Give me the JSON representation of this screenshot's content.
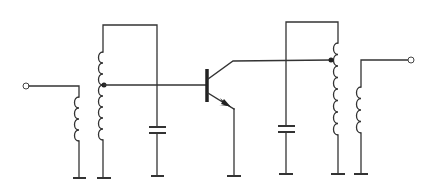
{
  "diagram": {
    "title": "",
    "type": "tuned transistor amplifier schematic",
    "colors": {
      "line": "#333333",
      "background": "#ffffff"
    },
    "components": [
      {
        "id": "input-terminal",
        "kind": "terminal",
        "label": ""
      },
      {
        "id": "input-coil",
        "kind": "inductor",
        "label": ""
      },
      {
        "id": "input-tank-coil",
        "kind": "tapped-inductor",
        "label": ""
      },
      {
        "id": "input-tank-capacitor",
        "kind": "capacitor",
        "label": ""
      },
      {
        "id": "transistor",
        "kind": "npn-transistor",
        "label": ""
      },
      {
        "id": "output-tank-capacitor",
        "kind": "capacitor",
        "label": ""
      },
      {
        "id": "output-tank-coil",
        "kind": "tapped-inductor",
        "label": ""
      },
      {
        "id": "output-coil",
        "kind": "inductor",
        "label": ""
      },
      {
        "id": "output-terminal",
        "kind": "terminal",
        "label": ""
      }
    ],
    "grounds": 7
  }
}
